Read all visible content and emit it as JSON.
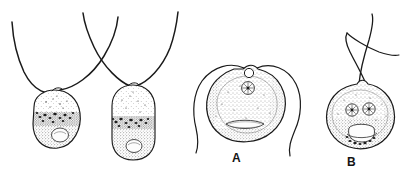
{
  "figure": {
    "kind": "scientific-line-drawing",
    "width": 405,
    "height": 181,
    "background_color": "#ffffff",
    "ink_color": "#1a1a1a",
    "stipple_color": "#4a4a4a"
  },
  "labels": [
    {
      "id": "A",
      "text": "A"
    },
    {
      "id": "B",
      "text": "B"
    }
  ],
  "specimens": [
    {
      "id": "cell-1",
      "label": "",
      "body_shape": "ovoid",
      "flagella_count": 2,
      "nuclei_count": 0,
      "vacuoles_count": 1,
      "granule_band": true
    },
    {
      "id": "cell-2",
      "label": "",
      "body_shape": "elongate-capsule",
      "flagella_count": 2,
      "nuclei_count": 0,
      "vacuoles_count": 1,
      "granule_band": true
    },
    {
      "id": "cell-A",
      "label": "A",
      "body_shape": "broad-rounded-notched",
      "flagella_count": 2,
      "nuclei_count": 1,
      "vacuoles_count": 1,
      "granule_band": false,
      "blepharoplast": true
    },
    {
      "id": "cell-B",
      "label": "B",
      "body_shape": "round-notched",
      "flagella_count": 2,
      "nuclei_count": 2,
      "vacuoles_count": 1,
      "granule_band": true,
      "blepharoplast": false
    }
  ]
}
